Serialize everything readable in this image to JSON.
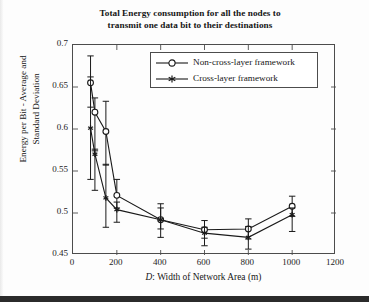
{
  "chart_data": {
    "type": "line",
    "title": "Total Energy consumption for all the nodes to transmit one data bit to their destinations",
    "title_line1": "Total Energy consumption for all the nodes to",
    "title_line2": "transmit one data bit to their destinations",
    "xlabel_prefix": "D",
    "xlabel_rest": ": Width of Network Area (m)",
    "xlabel": "D: Width of Network Area (m)",
    "ylabel_line1": "Energy per Bit - Average and",
    "ylabel_line2": "Standard Deviation",
    "ylabel": "Energy per Bit - Average and Standard Deviation",
    "xlim": [
      0,
      1200
    ],
    "ylim": [
      0.45,
      0.7
    ],
    "xticks": [
      0,
      200,
      400,
      600,
      800,
      1000,
      1200
    ],
    "yticks": [
      0.45,
      0.5,
      0.55,
      0.6,
      0.65,
      0.7
    ],
    "ytick_labels": [
      "0.45",
      "0.5",
      "0.55",
      "0.6",
      "0.65",
      "0.7"
    ],
    "xtick_labels": [
      "0",
      "200",
      "400",
      "600",
      "800",
      "1000",
      "1200"
    ],
    "grid": false,
    "legend_position": "upper right inside",
    "error_bars": true,
    "series": [
      {
        "name": "Non-cross-layer framework",
        "marker": "open-circle",
        "color": "#1a1a1a",
        "x": [
          80,
          100,
          150,
          200,
          400,
          600,
          800,
          1000
        ],
        "values": [
          0.655,
          0.62,
          0.597,
          0.521,
          0.492,
          0.48,
          0.481,
          0.508
        ],
        "err_low": [
          0.029,
          0.046,
          0.04,
          0.015,
          0.011,
          0.01,
          0.012,
          0.012
        ],
        "err_high": [
          0.032,
          0.017,
          0.036,
          0.019,
          0.014,
          0.011,
          0.012,
          0.012
        ]
      },
      {
        "name": "Cross-layer framework",
        "marker": "filled-star",
        "color": "#1a1a1a",
        "x": [
          80,
          100,
          150,
          200,
          400,
          600,
          800,
          1000
        ],
        "values": [
          0.601,
          0.57,
          0.518,
          0.504,
          0.492,
          0.476,
          0.471,
          0.498
        ],
        "err_low": [
          0.061,
          0.043,
          0.035,
          0.015,
          0.021,
          0.015,
          0.014,
          0.02
        ],
        "err_high": [
          0.061,
          0.006,
          0.04,
          0.009,
          0.019,
          0.007,
          0.013,
          0.008
        ]
      }
    ]
  },
  "legend": {
    "items": [
      {
        "label": "Non-cross-layer framework",
        "marker": "open-circle"
      },
      {
        "label": "Cross-layer framework",
        "marker": "filled-star"
      }
    ]
  }
}
